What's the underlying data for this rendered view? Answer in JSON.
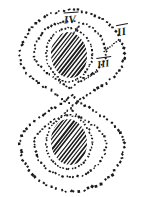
{
  "figure": {
    "background_color": "#ffffff",
    "ink_color": "#1a1a1a",
    "width": 144,
    "height": 197,
    "labels": [
      {
        "id": "iv",
        "text": "IV",
        "overline": true,
        "x": 64,
        "y": 12,
        "rotation": -4,
        "font_size": 11,
        "leader_line": {
          "x1": 79,
          "y1": 26,
          "x2": 74,
          "y2": 33
        }
      },
      {
        "id": "ii",
        "text": "II",
        "overline": true,
        "x": 117,
        "y": 24,
        "rotation": -10,
        "font_size": 11,
        "leader_line": {
          "x1": 118,
          "y1": 40,
          "x2": 104,
          "y2": 52
        }
      },
      {
        "id": "iii",
        "text": "III",
        "overline": true,
        "x": 97,
        "y": 57,
        "rotation": -8,
        "font_size": 10,
        "leader_line": {
          "x1": 97,
          "y1": 71,
          "x2": 85,
          "y2": 80
        }
      }
    ],
    "contours": [
      {
        "id": "outer-figure-eight",
        "name": "outer-dotted-contour",
        "dot_size": 2.1,
        "dot_spacing": 4.4,
        "lobes": [
          {
            "cx": 72,
            "cy": 58,
            "rx": 52,
            "ry": 48
          },
          {
            "cx": 72,
            "cy": 143,
            "rx": 52,
            "ry": 48
          }
        ]
      },
      {
        "id": "middle-figure-eight",
        "name": "middle-dotted-contour",
        "dot_size": 1.8,
        "dot_spacing": 3.6,
        "lobes": [
          {
            "cx": 70,
            "cy": 55,
            "rx": 36,
            "ry": 34
          },
          {
            "cx": 70,
            "cy": 143,
            "rx": 36,
            "ry": 34
          }
        ]
      },
      {
        "id": "inner-ovals",
        "name": "inner-dotted-contour",
        "dot_size": 1.6,
        "dot_spacing": 3.2,
        "lobes": [
          {
            "cx": 69,
            "cy": 55,
            "rx": 23,
            "ry": 27
          },
          {
            "cx": 69,
            "cy": 142,
            "rx": 23,
            "ry": 27
          }
        ]
      }
    ],
    "hatched_bodies": [
      {
        "id": "upper-nucleus",
        "name": "upper-hatched-body",
        "cx": 69,
        "cy": 55,
        "rx": 18,
        "ry": 23,
        "hatch_angle": -52,
        "hatch_spacing": 3.1,
        "hatch_width": 1.5
      },
      {
        "id": "lower-nucleus",
        "name": "lower-hatched-body",
        "cx": 69,
        "cy": 142,
        "rx": 18,
        "ry": 23,
        "hatch_angle": -52,
        "hatch_spacing": 3.1,
        "hatch_width": 1.5
      }
    ]
  }
}
